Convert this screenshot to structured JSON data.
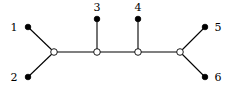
{
  "diagram": {
    "type": "tree",
    "title": "",
    "leaves": [
      {
        "id": "1",
        "label": "1",
        "x": 28,
        "y": 27,
        "lx": 14,
        "ly": 31,
        "anchor": "middle"
      },
      {
        "id": "2",
        "label": "2",
        "x": 28,
        "y": 77,
        "lx": 14,
        "ly": 81,
        "anchor": "middle"
      },
      {
        "id": "3",
        "label": "3",
        "x": 97,
        "y": 19,
        "lx": 97,
        "ly": 11,
        "anchor": "middle"
      },
      {
        "id": "4",
        "label": "4",
        "x": 138,
        "y": 19,
        "lx": 138,
        "ly": 11,
        "anchor": "middle"
      },
      {
        "id": "5",
        "label": "5",
        "x": 205,
        "y": 27,
        "lx": 218,
        "ly": 31,
        "anchor": "middle"
      },
      {
        "id": "6",
        "label": "6",
        "x": 205,
        "y": 77,
        "lx": 218,
        "ly": 81,
        "anchor": "middle"
      }
    ],
    "internal_nodes": [
      {
        "id": "a",
        "x": 54,
        "y": 52
      },
      {
        "id": "b",
        "x": 97,
        "y": 52
      },
      {
        "id": "c",
        "x": 138,
        "y": 52
      },
      {
        "id": "d",
        "x": 180,
        "y": 52
      }
    ],
    "edges": [
      [
        "1",
        "a"
      ],
      [
        "2",
        "a"
      ],
      [
        "a",
        "b"
      ],
      [
        "3",
        "b"
      ],
      [
        "b",
        "c"
      ],
      [
        "4",
        "c"
      ],
      [
        "c",
        "d"
      ],
      [
        "5",
        "d"
      ],
      [
        "6",
        "d"
      ]
    ],
    "colors": {
      "stroke": "#000000",
      "leaf_fill": "#000000",
      "internal_fill": "#ffffff"
    }
  }
}
